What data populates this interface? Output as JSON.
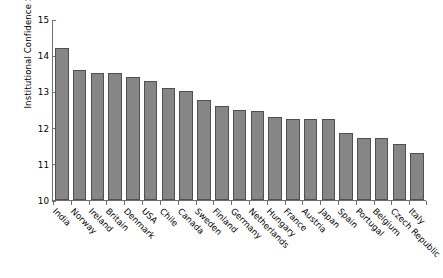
{
  "chart_data": {
    "type": "bar",
    "title": "",
    "xlabel": "",
    "ylabel": "Institutional Confidence Scale",
    "ylim": [
      10,
      15
    ],
    "yticks": [
      10,
      11,
      12,
      13,
      14,
      15
    ],
    "grid": false,
    "legend": null,
    "bar_color": "#868686",
    "bar_edge_color": "#4f4f4f",
    "categories": [
      "India",
      "Norway",
      "Ireland",
      "Britain",
      "Denmark",
      "USA",
      "Chile",
      "Canada",
      "Sweden",
      "Finland",
      "Germany",
      "Netherlands",
      "Hungary",
      "France",
      "Austria",
      "Japan",
      "Spain",
      "Portugal",
      "Belgium",
      "Czech Republic",
      "Italy"
    ],
    "values": [
      14.2,
      13.6,
      13.5,
      13.5,
      13.4,
      13.3,
      13.1,
      13.0,
      12.75,
      12.6,
      12.5,
      12.45,
      12.3,
      12.25,
      12.25,
      12.25,
      11.85,
      11.7,
      11.7,
      11.55,
      11.3
    ]
  }
}
